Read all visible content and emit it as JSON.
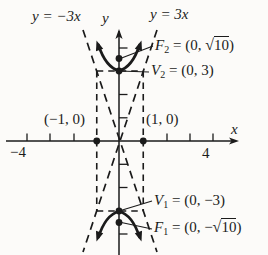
{
  "colors": {
    "ink": "#1b1b1b",
    "paper": "#fcfbf9"
  },
  "labels": {
    "asymptote_left": "y = −3x",
    "asymptote_right": "y = 3x",
    "y_axis": "y",
    "x_axis": "x",
    "x_left_value": "−4",
    "x_right_value": "4",
    "x_intercept_left": "(−1, 0)",
    "x_intercept_right": "(1, 0)",
    "focus2": {
      "name": "F",
      "sub": "2",
      "pre": " = (0, ",
      "radical_sign": "√",
      "radicand": "10",
      "post": ")"
    },
    "vertex2": {
      "name": "V",
      "sub": "2",
      "rest": " = (0, 3)"
    },
    "vertex1": {
      "name": "V",
      "sub": "1",
      "rest": " = (0, −3)"
    },
    "focus1": {
      "name": "F",
      "sub": "1",
      "pre": " = (0, −",
      "radical_sign": "√",
      "radicand": "10",
      "post": ")"
    }
  },
  "graph": {
    "type": "hyperbola-diagram",
    "asymptote_equations": [
      "y = −3x",
      "y = 3x"
    ],
    "vertices": [
      [
        0,
        3
      ],
      [
        0,
        -3
      ]
    ],
    "foci_y_values": [
      "√10",
      "−√10"
    ],
    "marked_x_points": [
      [
        -1,
        0
      ],
      [
        1,
        0
      ]
    ],
    "x_axis_labeled_range": [
      -4,
      4
    ],
    "dashed_rectangle": {
      "x": [
        -1,
        1
      ],
      "y": [
        -3,
        3
      ]
    },
    "branches": "opens up and down"
  }
}
